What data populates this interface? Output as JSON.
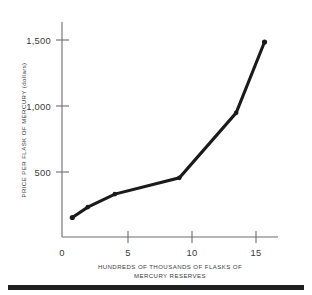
{
  "figure": {
    "background_color": "#ffffff",
    "line_color": "#1a1a1a",
    "axis_color": "#6d6d6d",
    "bottom_rule_color": "#201f1f"
  },
  "axes": {
    "y_title": "PRICE PER FLASK OF MERCURY (dollars)",
    "x_title_line1": "HUNDREDS OF THOUSANDS OF FLASKS OF",
    "x_title_line2": "MERCURY RESERVES",
    "y_ticks": [
      {
        "value": 500,
        "label": "500"
      },
      {
        "value": 1000,
        "label": "1,000"
      },
      {
        "value": 1500,
        "label": "1,500"
      }
    ],
    "x_ticks": [
      {
        "value": 0,
        "label": "0"
      },
      {
        "value": 5,
        "label": "5"
      },
      {
        "value": 10,
        "label": "10"
      },
      {
        "value": 15,
        "label": "15"
      }
    ]
  },
  "chart_data": {
    "type": "line",
    "title": "",
    "xlabel": "HUNDREDS OF THOUSANDS OF FLASKS OF MERCURY RESERVES",
    "ylabel": "PRICE PER FLASK OF MERCURY (dollars)",
    "xlim": [
      0,
      16.5
    ],
    "ylim": [
      0,
      1650
    ],
    "grid": false,
    "legend": false,
    "x": [
      0.8,
      2.0,
      4.1,
      9.1,
      13.5,
      15.7
    ],
    "y": [
      150,
      230,
      330,
      455,
      955,
      1500
    ],
    "series": [
      {
        "name": "Mercury price vs reserves",
        "points": [
          {
            "x": 0.8,
            "y": 150
          },
          {
            "x": 2.0,
            "y": 230
          },
          {
            "x": 4.1,
            "y": 330
          },
          {
            "x": 9.1,
            "y": 455
          },
          {
            "x": 13.5,
            "y": 955
          },
          {
            "x": 15.7,
            "y": 1500
          }
        ]
      }
    ]
  }
}
